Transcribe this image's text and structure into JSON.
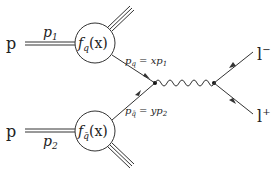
{
  "diagram": {
    "type": "feynman",
    "process": "Drell-Yan",
    "colors": {
      "line": "#333333",
      "text": "#222222",
      "background": "#ffffff"
    },
    "proton_top": {
      "label": "p",
      "momentum": "p",
      "momentum_sub": "1"
    },
    "proton_bottom": {
      "label": "p",
      "momentum": "p",
      "momentum_sub": "2"
    },
    "pdf_top": {
      "f": "f",
      "sub": "q",
      "arg": "(x)"
    },
    "pdf_bottom": {
      "f": "f",
      "sub": "q̄",
      "arg": "(x)"
    },
    "quark_top": {
      "p": "p",
      "sub": "q",
      "eq": " = ",
      "coef": "x",
      "mp": "p",
      "mp_sub": "1"
    },
    "quark_bottom": {
      "p": "p",
      "sub": "q̄",
      "eq": " = ",
      "coef": "y",
      "mp": "p",
      "mp_sub": "2"
    },
    "lepton_minus": {
      "label": "l",
      "sup": "−"
    },
    "lepton_plus": {
      "label": "l",
      "sup": "+"
    }
  }
}
